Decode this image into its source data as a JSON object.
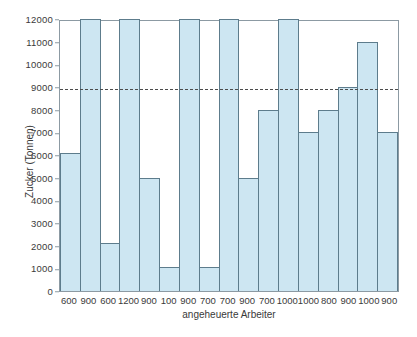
{
  "chart_data": {
    "type": "bar",
    "title": "",
    "subtitle": "",
    "xlabel": "angeheuerte Arbeiter",
    "ylabel": "Zucker (Tonnen)",
    "categories": [
      "600",
      "900",
      "600",
      "1200",
      "900",
      "100",
      "900",
      "700",
      "700",
      "900",
      "700",
      "1000",
      "1000",
      "800",
      "900",
      "1000",
      "900"
    ],
    "values": [
      6100,
      12000,
      2100,
      12000,
      5000,
      1050,
      12000,
      1050,
      12000,
      5000,
      8000,
      12000,
      7000,
      8000,
      9000,
      11000,
      7000
    ],
    "ylim": [
      0,
      12000
    ],
    "ytick_labels": [
      "12000",
      "11000",
      "10000",
      "9000",
      "8000",
      "7000",
      "6000",
      "5000",
      "4000",
      "3000",
      "2000",
      "1000",
      "0"
    ],
    "ytick_values": [
      12000,
      11000,
      10000,
      9000,
      8000,
      7000,
      6000,
      5000,
      4000,
      3000,
      2000,
      1000,
      0
    ],
    "grid": false,
    "legend": "none",
    "annotations": [
      {
        "type": "reference-line",
        "orientation": "horizontal",
        "value": 9000,
        "style": "dashed",
        "color": "#4c4c4c"
      }
    ],
    "colors": {
      "bar_fill": "#cde6f2",
      "bar_stroke": "#5d7c8c",
      "axis": "#8c9aa3",
      "text": "#3a3a3a",
      "reference_line": "#4c4c4c",
      "background": "#ffffff"
    }
  }
}
